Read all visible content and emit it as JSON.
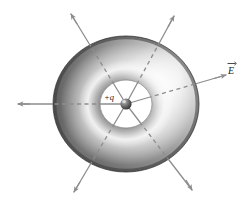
{
  "figure": {
    "kind": "physics-diagram",
    "background_color": "#ffffff"
  },
  "charge": {
    "label": "+q",
    "sign": "positive",
    "sphere_color": "#5a5a5a",
    "sphere_highlight_color": "#d8d8d8",
    "center_x": 126,
    "center_y": 104,
    "radius": 5.6
  },
  "torus": {
    "name": "doughnut-surface",
    "center_x": 126,
    "center_y": 104,
    "outer_radius_x": 73,
    "outer_radius_y": 68,
    "hole_radius_x": 26,
    "hole_radius_y": 24,
    "dark_color": "#4a4a4a",
    "mid_color": "#9a9a9a",
    "highlight_color": "#fdfdfd",
    "edge_color": "#3d3d3d",
    "light_direction": "upper-right"
  },
  "field_label": {
    "text": "E",
    "notation": "vector-arrow-overbar",
    "x": 232,
    "y": 72
  },
  "field_lines": [
    {
      "name": "field-line-right",
      "angle_deg": -20,
      "labeled": true,
      "tip_x": 226,
      "tip_y": 75
    },
    {
      "name": "field-line-upper-right",
      "angle_deg": -65,
      "labeled": false,
      "tip_x": 174,
      "tip_y": 16
    },
    {
      "name": "field-line-upper-left",
      "angle_deg": -115,
      "labeled": false,
      "tip_x": 71,
      "tip_y": 14
    },
    {
      "name": "field-line-left",
      "angle_deg": 180,
      "labeled": false,
      "tip_x": 18,
      "tip_y": 104
    },
    {
      "name": "field-line-lower-left",
      "angle_deg": 115,
      "labeled": false,
      "tip_x": 74,
      "tip_y": 192
    },
    {
      "name": "field-line-lower-right",
      "angle_deg": 62,
      "labeled": false,
      "tip_x": 192,
      "tip_y": 190
    }
  ],
  "style": {
    "field_line_color": "#8d8d8d",
    "field_line_dark_color": "#707070",
    "field_line_width": 1.3,
    "hidden_segment_dash": "4,3.5"
  }
}
